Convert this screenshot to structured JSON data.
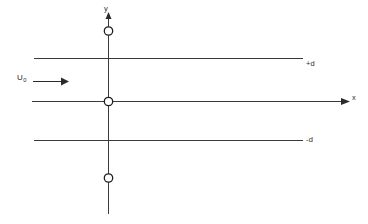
{
  "figure": {
    "background_color": "#ffffff",
    "line_color": "#3a3a3a",
    "label_color": "#2b2b2b",
    "axes": {
      "x_axis": {
        "label": "x",
        "icon": "arrow-right-icon",
        "y_position": 101,
        "x_start": 32,
        "x_end": 345
      },
      "y_axis": {
        "label": "y",
        "icon": "arrow-up-icon",
        "x_position": 108,
        "y_start": 14,
        "y_end": 214
      }
    },
    "walls": [
      {
        "name": "upper-wall",
        "label": "+d",
        "y_position": 58,
        "x_start": 34,
        "x_end": 303
      },
      {
        "name": "lower-wall",
        "label": "-d",
        "y_position": 140,
        "x_start": 34,
        "x_end": 303
      }
    ],
    "flow": {
      "label": "U",
      "label_subscript": "0",
      "icon": "arrow-right-icon",
      "arrow_y": 81,
      "arrow_x_start": 33,
      "arrow_x_end": 67
    },
    "markers": [
      {
        "name": "upper-marker",
        "cx": 108,
        "cy": 31,
        "r": 4.2
      },
      {
        "name": "origin-marker",
        "cx": 108,
        "cy": 101,
        "r": 4.2
      },
      {
        "name": "lower-marker",
        "cx": 108,
        "cy": 178,
        "r": 4.2
      }
    ]
  }
}
